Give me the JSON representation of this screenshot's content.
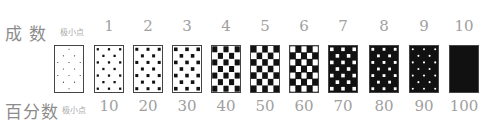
{
  "labels": {
    "grade_row": "成  数",
    "percent_row": "百分数",
    "minimal_dot": "极小点"
  },
  "items": [
    {
      "grade": "极小点",
      "percent": "极小点",
      "pattern": "tiny-dots"
    },
    {
      "grade": "1",
      "percent": "10",
      "pattern": "small-black-dots"
    },
    {
      "grade": "2",
      "percent": "20",
      "pattern": "medium-black-squares"
    },
    {
      "grade": "3",
      "percent": "30",
      "pattern": "larger-black-squares"
    },
    {
      "grade": "4",
      "percent": "40",
      "pattern": "near-checker-black"
    },
    {
      "grade": "5",
      "percent": "50",
      "pattern": "checkerboard"
    },
    {
      "grade": "6",
      "percent": "60",
      "pattern": "near-checker-white"
    },
    {
      "grade": "7",
      "percent": "70",
      "pattern": "larger-white-squares"
    },
    {
      "grade": "8",
      "percent": "80",
      "pattern": "medium-white-squares"
    },
    {
      "grade": "9",
      "percent": "90",
      "pattern": "small-white-dots"
    },
    {
      "grade": "10",
      "percent": "100",
      "pattern": "solid-black"
    }
  ],
  "colors": {
    "ink": "#111111",
    "paper": "#ffffff",
    "label": "#9a9a9a",
    "border": "#444444"
  }
}
